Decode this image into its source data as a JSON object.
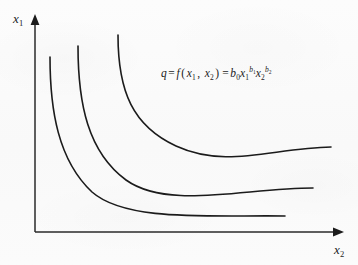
{
  "figure": {
    "kind": "isoquant-diagram",
    "background_color": "#fbfbfb",
    "ink_color": "#1b1b1b"
  },
  "axes": {
    "y_axis": {
      "label_variable": "x",
      "label_subscript": "1",
      "arrowhead": "up",
      "x_px": 35,
      "top_px": 18,
      "bottom_px": 232,
      "color": "#2a2a2a"
    },
    "x_axis": {
      "label_variable": "x",
      "label_subscript": "2",
      "arrowhead": "right",
      "y_px": 232,
      "left_px": 35,
      "right_px": 342,
      "color": "#2a2a2a"
    }
  },
  "equation": {
    "q": "q",
    "eq1": "=",
    "f": "f",
    "open": "(",
    "arg1_var": "x",
    "arg1_sub": "1",
    "comma": ",",
    "arg2_var": "x",
    "arg2_sub": "2",
    "close": ")",
    "eq2": "=",
    "coef_var": "b",
    "coef_sub": "0",
    "t1_var": "x",
    "t1_sub": "1",
    "t1_exp_var": "b",
    "t1_exp_sub": "1",
    "t2_var": "x",
    "t2_sub": "2",
    "t2_exp_var": "b",
    "t2_exp_sub": "2",
    "plain_text": "q = f(x1, x2) = b0 x1^b1 x2^b2"
  },
  "chart_data": {
    "type": "line",
    "title": "",
    "xlabel": "x2",
    "ylabel": "x1",
    "grid": false,
    "legend": "none",
    "curve_color": "#1b1b1b",
    "curve_width_px": 1.6,
    "series": [
      {
        "name": "isoquant-low",
        "path": "M 50 57 C 50 110, 58 160, 92 192 C 126 222, 210 215, 285 216",
        "start_px": [
          50,
          57
        ],
        "end_px": [
          285,
          216
        ],
        "asymptote_x_px": 48,
        "asymptote_y_px": 218
      },
      {
        "name": "isoquant-mid",
        "path": "M 78 46 C 78 104, 88 152, 126 180 C 168 210, 245 188, 313 188",
        "start_px": [
          78,
          46
        ],
        "end_px": [
          313,
          188
        ],
        "asymptote_x_px": 76,
        "asymptote_y_px": 190
      },
      {
        "name": "isoquant-high",
        "path": "M 118 35 C 118 92, 133 126, 176 146 C 226 169, 272 148, 331 147",
        "start_px": [
          118,
          35
        ],
        "end_px": [
          331,
          147
        ],
        "asymptote_x_px": 116,
        "asymptote_y_px": 149
      }
    ]
  }
}
